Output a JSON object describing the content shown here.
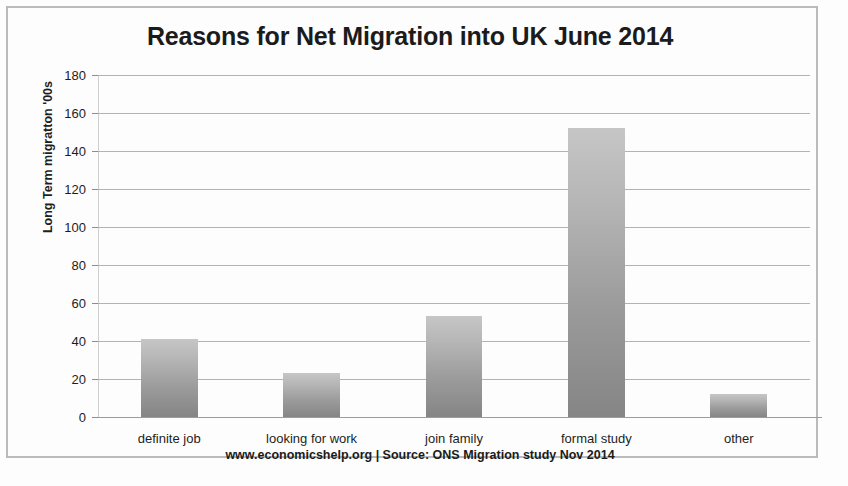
{
  "chart_data": {
    "type": "bar",
    "title": "Reasons for Net Migration into UK June 2014",
    "xlabel": "",
    "ylabel": "Long Term migratton '00s",
    "categories": [
      "definite job",
      "looking for work",
      "join family",
      "formal study",
      "other"
    ],
    "values": [
      41,
      23,
      53,
      152,
      12
    ],
    "series": [
      {
        "name": "Long Term migration '00s",
        "values": [
          41,
          23,
          53,
          152,
          12
        ]
      }
    ],
    "ylim": [
      0,
      180
    ],
    "ytick_step": 20,
    "yticks": [
      0,
      20,
      40,
      60,
      80,
      100,
      120,
      140,
      160,
      180
    ],
    "ytick_labels": [
      "0",
      "20",
      "40",
      "60",
      "80",
      "100",
      "120",
      "140",
      "160",
      "180"
    ],
    "grid": true,
    "legend": false,
    "legend_position": "none",
    "bar_color_top": "#c6c6c6",
    "bar_color_bottom": "#858585",
    "gridline_color": "#b3b3b3",
    "background_color": "#ffffff",
    "text_color": "#1b1b1b",
    "annotation": "www.economicshelp.org | Source: ONS Migration study Nov 2014"
  },
  "footer": {
    "source_note": "www.economicshelp.org | Source: ONS Migration study Nov 2014"
  }
}
